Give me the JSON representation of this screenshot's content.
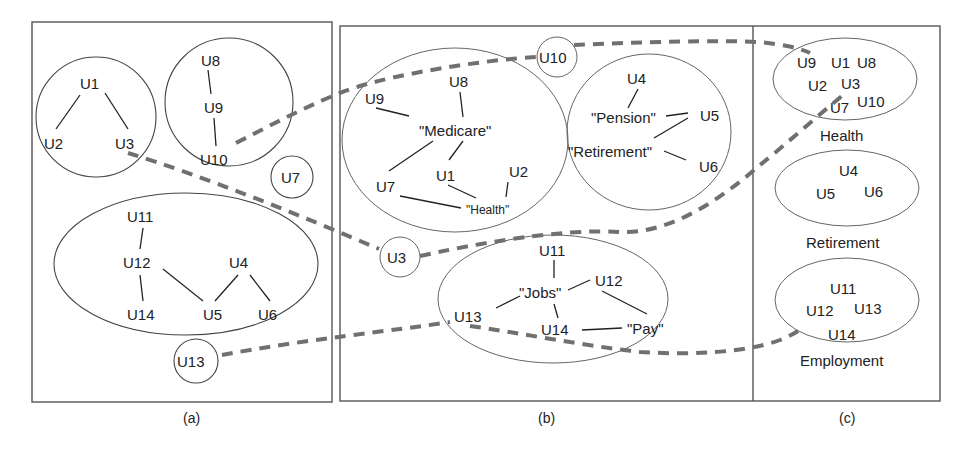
{
  "figure": {
    "colors": {
      "box_stroke": "#555555",
      "edge": "#222222",
      "dashed_path": "#707070",
      "text": "#222222",
      "background": "#ffffff"
    },
    "panel_a": {
      "caption": "(a)",
      "groups": [
        {
          "nodes": [
            "U1",
            "U2",
            "U3"
          ],
          "edges": [
            [
              "U1",
              "U2"
            ],
            [
              "U1",
              "U3"
            ]
          ]
        },
        {
          "nodes": [
            "U8",
            "U9",
            "U10"
          ],
          "edges": [
            [
              "U8",
              "U9"
            ],
            [
              "U9",
              "U10"
            ]
          ]
        },
        {
          "nodes": [
            "U7"
          ],
          "edges": []
        },
        {
          "nodes": [
            "U11",
            "U12",
            "U14",
            "U4",
            "U5",
            "U6"
          ],
          "edges": [
            [
              "U11",
              "U12"
            ],
            [
              "U12",
              "U14"
            ],
            [
              "U12",
              "U5"
            ],
            [
              "U4",
              "U5"
            ],
            [
              "U4",
              "U6"
            ]
          ]
        },
        {
          "nodes": [
            "U13"
          ],
          "edges": []
        }
      ],
      "labels": {
        "u1": "U1",
        "u2": "U2",
        "u3": "U3",
        "u8": "U8",
        "u9": "U9",
        "u10": "U10",
        "u7": "U7",
        "u11": "U11",
        "u12": "U12",
        "u14": "U14",
        "u4": "U4",
        "u5": "U5",
        "u6": "U6",
        "u13": "U13"
      }
    },
    "panel_b": {
      "caption": "(b)",
      "clusters": [
        {
          "name": "health",
          "nodes": [
            "U9",
            "U8",
            "U7",
            "U1",
            "U2"
          ],
          "topics": [
            "\"Medicare\"",
            "\"Health\""
          ]
        },
        {
          "name": "retirement",
          "nodes": [
            "U4",
            "U5",
            "U6"
          ],
          "topics": [
            "\"Pension\"",
            "\"Retirement\""
          ]
        },
        {
          "name": "employment",
          "nodes": [
            "U11",
            "U12",
            "U13",
            "U14"
          ],
          "topics": [
            "\"Jobs\"",
            "\"Pay\""
          ]
        }
      ],
      "outliers": [
        "U10",
        "U3"
      ],
      "labels": {
        "u9": "U9",
        "u8": "U8",
        "medicare": "\"Medicare\"",
        "u7": "U7",
        "u1": "U1",
        "u2": "U2",
        "health": "\"Health\"",
        "u10": "U10",
        "u4": "U4",
        "pension": "\"Pension\"",
        "u5": "U5",
        "retirement": "\"Retirement\"",
        "u6": "U6",
        "u3": "U3",
        "u11": "U11",
        "jobs": "\"Jobs\"",
        "u12": "U12",
        "u13": "U13",
        "u14": "U14",
        "pay": "\"Pay\""
      }
    },
    "panel_c": {
      "caption": "(c)",
      "categories": [
        {
          "label": "Health",
          "members": [
            "U9",
            "U1",
            "U8",
            "U2",
            "U3",
            "U7",
            "U10"
          ]
        },
        {
          "label": "Retirement",
          "members": [
            "U4",
            "U5",
            "U6"
          ]
        },
        {
          "label": "Employment",
          "members": [
            "U11",
            "U12",
            "U13",
            "U14"
          ]
        }
      ],
      "labels": {
        "u9": "U9",
        "u1": "U1",
        "u8": "U8",
        "u2": "U2",
        "u3": "U3",
        "u7": "U7",
        "u10": "U10",
        "health": "Health",
        "u4": "U4",
        "u5": "U5",
        "u6": "U6",
        "retirement": "Retirement",
        "u11": "U11",
        "u12": "U12",
        "u13": "U13",
        "u14": "U14",
        "employment": "Employment"
      }
    },
    "dashed_paths": [
      {
        "from": "(a) U10",
        "via": "(b) U10",
        "to": "(c) Health"
      },
      {
        "from": "(a) U3",
        "via": "(b) U3",
        "to": "(c) Health"
      },
      {
        "from": "(a) U13",
        "via": "(b) U13",
        "to": "(c) Employment"
      }
    ]
  }
}
